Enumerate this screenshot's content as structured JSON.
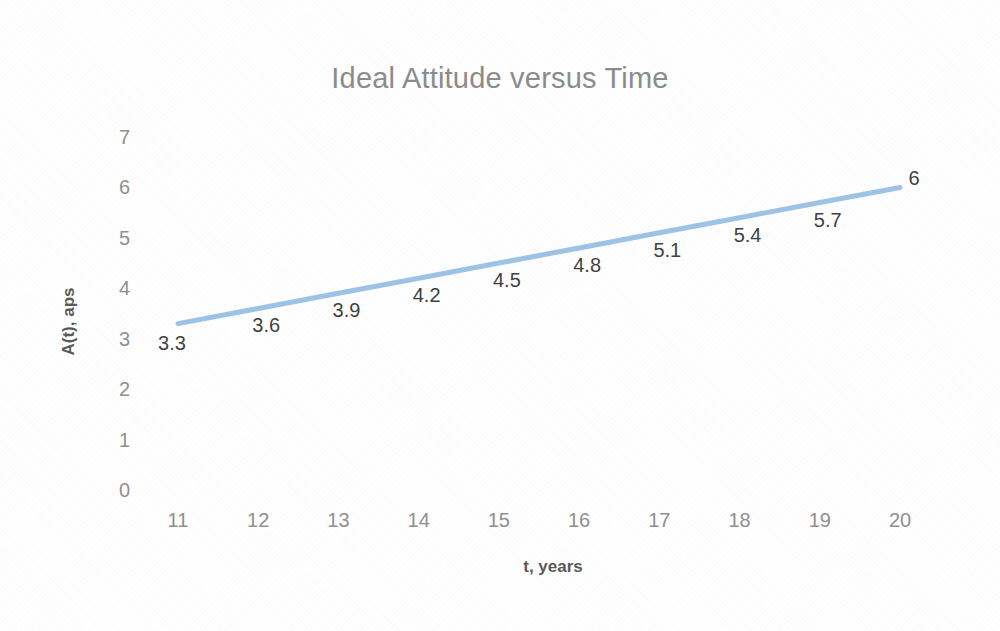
{
  "chart_data": {
    "type": "line",
    "title": "Ideal Attitude versus Time",
    "xlabel": "t, years",
    "ylabel": "A(t), aps",
    "x": [
      11,
      12,
      13,
      14,
      15,
      16,
      17,
      18,
      19,
      20
    ],
    "values": [
      3.3,
      3.6,
      3.9,
      4.2,
      4.5,
      4.8,
      5.1,
      5.4,
      5.7,
      6
    ],
    "point_labels": [
      "3.3",
      "3.6",
      "3.9",
      "4.2",
      "4.5",
      "4.8",
      "5.1",
      "5.4",
      "5.7",
      "6"
    ],
    "xtick_labels": [
      "11",
      "12",
      "13",
      "14",
      "15",
      "16",
      "17",
      "18",
      "19",
      "20"
    ],
    "ytick_labels": [
      "0",
      "1",
      "2",
      "3",
      "4",
      "5",
      "6",
      "7"
    ],
    "yticks": [
      0,
      1,
      2,
      3,
      4,
      5,
      6,
      7
    ],
    "xlim": [
      11,
      20
    ],
    "ylim": [
      0,
      7
    ],
    "grid": false,
    "legend": false,
    "legend_position": "none",
    "series_name": "A(t)",
    "line_color": "#9dc3e6",
    "line_width": 5,
    "title_color": "#8b8b8b",
    "tick_color": "#8f8f8f",
    "axis_title_color": "#595959",
    "label_color": "#3f3f3f",
    "plot_background": "#ffffff"
  }
}
